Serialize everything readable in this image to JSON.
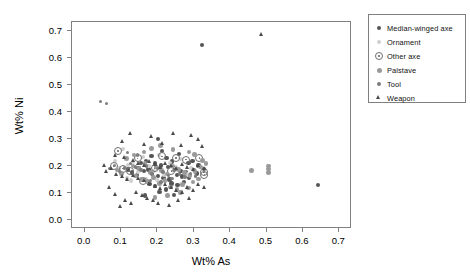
{
  "chart_data": {
    "type": "scatter",
    "title": "",
    "xlabel": "Wt% As",
    "ylabel": "Wt% Ni",
    "xlim": [
      -0.035,
      0.735
    ],
    "ylim": [
      -0.035,
      0.735
    ],
    "xticks": [
      "0.0",
      "0.1",
      "0.2",
      "0.3",
      "0.4",
      "0.5",
      "0.6",
      "0.7"
    ],
    "xtickvals": [
      0.0,
      0.1,
      0.2,
      0.3,
      0.4,
      0.5,
      0.6,
      0.7
    ],
    "yticks": [
      "0.0",
      "0.1",
      "0.2",
      "0.3",
      "0.4",
      "0.5",
      "0.6",
      "0.7"
    ],
    "ytickvals": [
      0.0,
      0.1,
      0.2,
      0.3,
      0.4,
      0.5,
      0.6,
      0.7
    ],
    "grid": false,
    "legend_position": "top-right",
    "series": [
      {
        "name": "Median-winged axe",
        "marker": "filled-circle",
        "color": "#555555",
        "size": 4.4,
        "points": [
          [
            0.325,
            0.645
          ],
          [
            0.205,
            0.295
          ],
          [
            0.228,
            0.225
          ],
          [
            0.243,
            0.213
          ],
          [
            0.196,
            0.205
          ],
          [
            0.213,
            0.198
          ],
          [
            0.231,
            0.191
          ],
          [
            0.252,
            0.186
          ],
          [
            0.266,
            0.178
          ],
          [
            0.281,
            0.172
          ],
          [
            0.178,
            0.182
          ],
          [
            0.165,
            0.176
          ],
          [
            0.151,
            0.188
          ],
          [
            0.188,
            0.166
          ],
          [
            0.204,
            0.159
          ],
          [
            0.219,
            0.152
          ],
          [
            0.236,
            0.146
          ],
          [
            0.256,
            0.163
          ],
          [
            0.271,
            0.156
          ],
          [
            0.289,
            0.151
          ],
          [
            0.304,
            0.181
          ],
          [
            0.311,
            0.168
          ],
          [
            0.146,
            0.161
          ],
          [
            0.133,
            0.172
          ],
          [
            0.121,
            0.183
          ],
          [
            0.241,
            0.131
          ],
          [
            0.258,
            0.124
          ],
          [
            0.276,
            0.136
          ],
          [
            0.196,
            0.121
          ],
          [
            0.181,
            0.128
          ],
          [
            0.226,
            0.108
          ],
          [
            0.208,
            0.098
          ],
          [
            0.288,
            0.206
          ],
          [
            0.299,
            0.214
          ],
          [
            0.316,
            0.198
          ],
          [
            0.331,
            0.184
          ],
          [
            0.158,
            0.206
          ],
          [
            0.172,
            0.215
          ],
          [
            0.186,
            0.232
          ],
          [
            0.262,
            0.241
          ],
          [
            0.215,
            0.252
          ],
          [
            0.248,
            0.088
          ],
          [
            0.168,
            0.086
          ],
          [
            0.645,
            0.125
          ]
        ]
      },
      {
        "name": "Ornament",
        "marker": "light-circle",
        "color": "#cfcfcf",
        "size": 4.2,
        "points": [
          [
            0.108,
            0.258
          ],
          [
            0.122,
            0.198
          ],
          [
            0.097,
            0.186
          ],
          [
            0.136,
            0.211
          ],
          [
            0.149,
            0.174
          ],
          [
            0.164,
            0.229
          ],
          [
            0.178,
            0.196
          ],
          [
            0.192,
            0.178
          ],
          [
            0.206,
            0.236
          ],
          [
            0.221,
            0.162
          ],
          [
            0.238,
            0.206
          ],
          [
            0.253,
            0.192
          ],
          [
            0.268,
            0.221
          ],
          [
            0.284,
            0.166
          ],
          [
            0.118,
            0.151
          ],
          [
            0.131,
            0.142
          ],
          [
            0.086,
            0.214
          ],
          [
            0.296,
            0.188
          ],
          [
            0.171,
            0.148
          ],
          [
            0.201,
            0.143
          ]
        ]
      },
      {
        "name": "Other axe",
        "marker": "open-circle",
        "color": "#6e6e6e",
        "size": 6.0,
        "points": [
          [
            0.095,
            0.252
          ],
          [
            0.082,
            0.196
          ],
          [
            0.108,
            0.186
          ],
          [
            0.148,
            0.224
          ],
          [
            0.162,
            0.141
          ],
          [
            0.216,
            0.231
          ],
          [
            0.254,
            0.226
          ],
          [
            0.281,
            0.219
          ],
          [
            0.318,
            0.226
          ],
          [
            0.331,
            0.172
          ],
          [
            0.332,
            0.164
          ],
          [
            0.126,
            0.178
          ],
          [
            0.196,
            0.188
          ],
          [
            0.241,
            0.176
          ]
        ]
      },
      {
        "name": "Palstave",
        "marker": "mid-circle",
        "color": "#9a9a9a",
        "size": 4.6,
        "points": [
          [
            0.118,
            0.223
          ],
          [
            0.135,
            0.196
          ],
          [
            0.152,
            0.186
          ],
          [
            0.168,
            0.204
          ],
          [
            0.184,
            0.172
          ],
          [
            0.199,
            0.192
          ],
          [
            0.214,
            0.178
          ],
          [
            0.229,
            0.166
          ],
          [
            0.246,
            0.196
          ],
          [
            0.261,
            0.182
          ],
          [
            0.277,
            0.171
          ],
          [
            0.292,
            0.161
          ],
          [
            0.306,
            0.176
          ],
          [
            0.321,
            0.192
          ],
          [
            0.104,
            0.168
          ],
          [
            0.091,
            0.181
          ],
          [
            0.143,
            0.158
          ],
          [
            0.159,
            0.146
          ],
          [
            0.176,
            0.138
          ],
          [
            0.192,
            0.152
          ],
          [
            0.208,
            0.131
          ],
          [
            0.224,
            0.142
          ],
          [
            0.239,
            0.118
          ],
          [
            0.256,
            0.108
          ],
          [
            0.271,
            0.126
          ],
          [
            0.288,
            0.114
          ],
          [
            0.301,
            0.136
          ],
          [
            0.316,
            0.148
          ],
          [
            0.211,
            0.271
          ],
          [
            0.246,
            0.258
          ],
          [
            0.289,
            0.248
          ],
          [
            0.304,
            0.238
          ],
          [
            0.186,
            0.261
          ],
          [
            0.166,
            0.248
          ],
          [
            0.138,
            0.236
          ],
          [
            0.336,
            0.206
          ],
          [
            0.326,
            0.216
          ],
          [
            0.461,
            0.178
          ],
          [
            0.508,
            0.196
          ],
          [
            0.508,
            0.184
          ],
          [
            0.508,
            0.171
          ],
          [
            0.266,
            0.096
          ],
          [
            0.231,
            0.086
          ],
          [
            0.196,
            0.078
          ]
        ]
      },
      {
        "name": "Tool",
        "marker": "small-circle",
        "color": "#7d7d7d",
        "size": 3.4,
        "points": [
          [
            0.046,
            0.436
          ],
          [
            0.062,
            0.428
          ],
          [
            0.128,
            0.206
          ],
          [
            0.143,
            0.192
          ],
          [
            0.158,
            0.181
          ],
          [
            0.173,
            0.196
          ],
          [
            0.188,
            0.168
          ],
          [
            0.203,
            0.186
          ],
          [
            0.218,
            0.173
          ],
          [
            0.233,
            0.161
          ],
          [
            0.248,
            0.178
          ],
          [
            0.263,
            0.166
          ],
          [
            0.278,
            0.154
          ],
          [
            0.112,
            0.188
          ],
          [
            0.098,
            0.176
          ],
          [
            0.084,
            0.198
          ],
          [
            0.071,
            0.186
          ],
          [
            0.293,
            0.168
          ],
          [
            0.308,
            0.158
          ],
          [
            0.148,
            0.236
          ],
          [
            0.121,
            0.246
          ],
          [
            0.183,
            0.142
          ],
          [
            0.213,
            0.136
          ],
          [
            0.243,
            0.148
          ]
        ]
      },
      {
        "name": "Weapon",
        "marker": "triangle",
        "color": "#4a4a4a",
        "size": 4.0,
        "points": [
          [
            0.49,
            0.685
          ],
          [
            0.128,
            0.318
          ],
          [
            0.186,
            0.306
          ],
          [
            0.246,
            0.316
          ],
          [
            0.296,
            0.308
          ],
          [
            0.316,
            0.296
          ],
          [
            0.106,
            0.288
          ],
          [
            0.166,
            0.276
          ],
          [
            0.216,
            0.281
          ],
          [
            0.268,
            0.272
          ],
          [
            0.326,
            0.268
          ],
          [
            0.088,
            0.236
          ],
          [
            0.113,
            0.226
          ],
          [
            0.136,
            0.218
          ],
          [
            0.151,
            0.206
          ],
          [
            0.166,
            0.196
          ],
          [
            0.181,
            0.212
          ],
          [
            0.196,
            0.201
          ],
          [
            0.211,
            0.191
          ],
          [
            0.226,
            0.206
          ],
          [
            0.241,
            0.196
          ],
          [
            0.256,
            0.186
          ],
          [
            0.271,
            0.201
          ],
          [
            0.286,
            0.191
          ],
          [
            0.301,
            0.181
          ],
          [
            0.316,
            0.196
          ],
          [
            0.331,
            0.186
          ],
          [
            0.076,
            0.186
          ],
          [
            0.063,
            0.176
          ],
          [
            0.091,
            0.166
          ],
          [
            0.106,
            0.156
          ],
          [
            0.121,
            0.146
          ],
          [
            0.136,
            0.161
          ],
          [
            0.151,
            0.151
          ],
          [
            0.166,
            0.141
          ],
          [
            0.181,
            0.131
          ],
          [
            0.196,
            0.121
          ],
          [
            0.211,
            0.111
          ],
          [
            0.226,
            0.126
          ],
          [
            0.241,
            0.116
          ],
          [
            0.256,
            0.106
          ],
          [
            0.271,
            0.096
          ],
          [
            0.286,
            0.116
          ],
          [
            0.301,
            0.106
          ],
          [
            0.316,
            0.126
          ],
          [
            0.331,
            0.116
          ],
          [
            0.146,
            0.096
          ],
          [
            0.161,
            0.086
          ],
          [
            0.176,
            0.076
          ],
          [
            0.191,
            0.066
          ],
          [
            0.116,
            0.068
          ],
          [
            0.086,
            0.088
          ],
          [
            0.206,
            0.056
          ],
          [
            0.261,
            0.066
          ],
          [
            0.291,
            0.076
          ],
          [
            0.071,
            0.116
          ],
          [
            0.056,
            0.196
          ],
          [
            0.101,
            0.046
          ],
          [
            0.236,
            0.048
          ],
          [
            0.131,
            0.056
          ]
        ]
      }
    ]
  },
  "legend": {
    "entries": [
      {
        "label": "Median-winged axe"
      },
      {
        "label": "Ornament"
      },
      {
        "label": "Other axe"
      },
      {
        "label": "Palstave"
      },
      {
        "label": "Tool"
      },
      {
        "label": "Weapon"
      }
    ]
  }
}
